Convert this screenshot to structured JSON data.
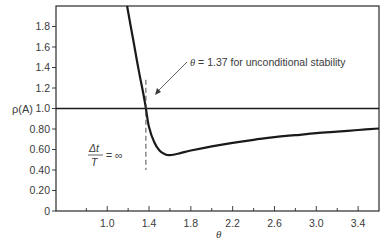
{
  "chart_data": {
    "type": "line",
    "title": "",
    "xlabel": "θ",
    "ylabel": "ρ(A)",
    "xlim": [
      0.51,
      3.6
    ],
    "ylim": [
      0,
      2.0
    ],
    "grid": false,
    "x_ticks_major": [
      1.0,
      1.4,
      1.8,
      2.2,
      2.6,
      3.0,
      3.4
    ],
    "x_ticks_major_labels": [
      "1.0",
      "1.4",
      "1.8",
      "2.2",
      "2.6",
      "3.0",
      "3.4"
    ],
    "x_ticks_minor": [
      0.8,
      1.2,
      1.6,
      2.0,
      2.4,
      2.8,
      3.2
    ],
    "y_ticks": [
      0,
      0.2,
      0.4,
      0.6,
      0.8,
      1.0,
      1.2,
      1.4,
      1.6,
      1.8
    ],
    "y_tick_labels": [
      "0",
      "0.20",
      "0.40",
      "0.60",
      "0.80",
      "1.0",
      "1.2",
      "1.4",
      "1.6",
      "1.8"
    ],
    "series": [
      {
        "name": "spectral radius",
        "x": [
          1.19,
          1.25,
          1.3,
          1.35,
          1.37,
          1.4,
          1.45,
          1.5,
          1.55,
          1.6,
          1.7,
          1.8,
          2.0,
          2.2,
          2.4,
          2.6,
          2.8,
          3.0,
          3.2,
          3.4,
          3.6
        ],
        "y": [
          2.0,
          1.66,
          1.38,
          1.12,
          1.0,
          0.82,
          0.67,
          0.59,
          0.555,
          0.545,
          0.565,
          0.59,
          0.63,
          0.665,
          0.695,
          0.72,
          0.74,
          0.76,
          0.775,
          0.79,
          0.805
        ]
      },
      {
        "name": "reference line",
        "x": [
          0.51,
          3.6
        ],
        "y": [
          1.0,
          1.0
        ]
      }
    ],
    "reference_lines": [
      {
        "orientation": "vertical",
        "x": 1.37,
        "y_range": [
          0.4,
          1.28
        ],
        "style": "dashed"
      }
    ],
    "annotations": [
      {
        "text_symbol": "θ",
        "text": " = 1.37 for unconditional stability",
        "arrow_to": [
          1.37,
          1.1
        ]
      },
      {
        "numerator": "Δt",
        "denominator": "T",
        "text": "= ∞"
      }
    ]
  },
  "colors": {
    "line": "#1a1a1a",
    "frame": "#2a2a2a",
    "text": "#3a3a3a"
  }
}
